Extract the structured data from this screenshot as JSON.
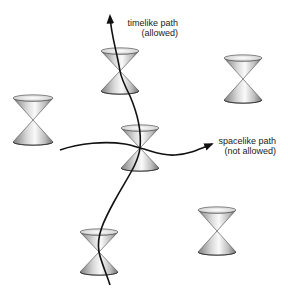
{
  "diagram": {
    "labels": {
      "timelike": {
        "line1": "timelike path",
        "line2": "(allowed)"
      },
      "spacelike": {
        "line1": "spacelike path",
        "line2": "(not allowed)"
      }
    },
    "cones": [
      {
        "id": "top",
        "apex": [
          120,
          71
        ],
        "half_width": 19,
        "half_height": 20
      },
      {
        "id": "middle",
        "apex": [
          140,
          148
        ],
        "half_width": 19,
        "half_height": 20
      },
      {
        "id": "left",
        "apex": [
          33,
          120
        ],
        "half_width": 20,
        "half_height": 22
      },
      {
        "id": "right-top",
        "apex": [
          243,
          79
        ],
        "half_width": 19,
        "half_height": 21
      },
      {
        "id": "right-bottom",
        "apex": [
          217,
          231
        ],
        "half_width": 19,
        "half_height": 21
      },
      {
        "id": "bottom",
        "apex": [
          99,
          252
        ],
        "half_width": 19,
        "half_height": 20
      }
    ],
    "paths": {
      "timelike": "allowed",
      "spacelike": "not allowed"
    },
    "colors": {
      "line": "#111111",
      "cone_light": "#f4f4f4",
      "cone_dark": "#8a8a8a",
      "background": "#ffffff"
    }
  }
}
